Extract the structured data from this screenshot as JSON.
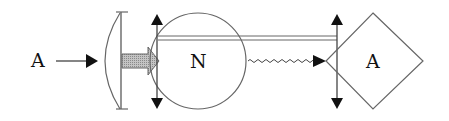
{
  "diagram": {
    "input_label": "A",
    "center_node_label": "N",
    "output_node_label": "A",
    "colors": {
      "stroke": "#555555",
      "arrowhead": "#111111",
      "fill_arrow": "#b8b8b8",
      "background": "#ffffff"
    },
    "elements": [
      {
        "type": "label",
        "text": "A",
        "role": "input"
      },
      {
        "type": "arrow",
        "style": "solid",
        "from": "input",
        "to": "lens"
      },
      {
        "type": "lens",
        "shape": "plano-convex"
      },
      {
        "type": "arrow",
        "style": "thick-shaded",
        "from": "lens",
        "to": "N"
      },
      {
        "type": "double-arrow",
        "orientation": "vertical",
        "position": "left-of-N"
      },
      {
        "type": "circle",
        "label": "N"
      },
      {
        "type": "double-line",
        "from": "N",
        "to": "A-diamond"
      },
      {
        "type": "arrow",
        "style": "wavy",
        "from": "N",
        "to": "A-diamond"
      },
      {
        "type": "double-arrow",
        "orientation": "vertical",
        "position": "left-of-A"
      },
      {
        "type": "diamond",
        "label": "A"
      }
    ]
  }
}
